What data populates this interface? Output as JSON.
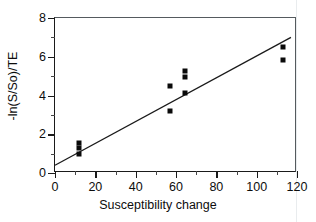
{
  "chart_data": {
    "type": "scatter",
    "title": "",
    "xlabel": "Susceptibility change",
    "ylabel": "-ln(S/So)/TE",
    "xlim": [
      0,
      120
    ],
    "ylim": [
      0,
      8
    ],
    "xticks": [
      0,
      20,
      40,
      60,
      80,
      100,
      120
    ],
    "yticks": [
      0,
      2,
      4,
      6,
      8
    ],
    "xtick_labels": [
      "0",
      "20",
      "40",
      "60",
      "80",
      "100",
      "120"
    ],
    "ytick_labels": [
      "0",
      "2",
      "4",
      "6",
      "8"
    ],
    "xminor_ticks": [
      10,
      30,
      50,
      70,
      90,
      110
    ],
    "yminor_ticks": [
      1,
      3,
      5,
      7
    ],
    "grid": false,
    "legend": "none",
    "marker": "square",
    "marker_color": "#0a0a0a",
    "points": [
      {
        "x": 12,
        "y": 1.55
      },
      {
        "x": 12,
        "y": 1.3
      },
      {
        "x": 12,
        "y": 1.0
      },
      {
        "x": 57,
        "y": 4.5
      },
      {
        "x": 57,
        "y": 3.2
      },
      {
        "x": 64.5,
        "y": 5.25
      },
      {
        "x": 64.5,
        "y": 4.95
      },
      {
        "x": 64.5,
        "y": 4.15
      },
      {
        "x": 113,
        "y": 6.5
      },
      {
        "x": 113,
        "y": 5.85
      }
    ],
    "fit_line": {
      "type": "line",
      "color": "#1a1a1a",
      "x_start": 0,
      "y_start": 0.4,
      "x_end": 117,
      "y_end": 7.0
    }
  },
  "axis_titles": {
    "x": "Susceptibility change",
    "y": "-ln(S/So)/TE"
  }
}
